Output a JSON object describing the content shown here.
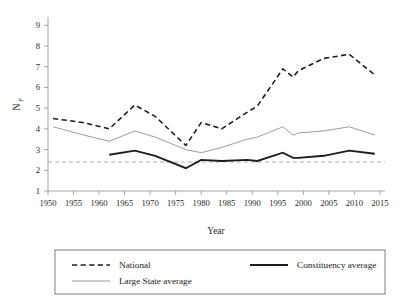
{
  "chart_data": {
    "type": "line",
    "title": "",
    "xlabel": "Year",
    "ylabel": "N_F",
    "ylabel_main": "N",
    "ylabel_sub": "F",
    "xlim": [
      1950,
      2016
    ],
    "ylim": [
      1,
      9.4
    ],
    "grid": false,
    "xticks": [
      1950,
      1955,
      1960,
      1965,
      1970,
      1975,
      1980,
      1985,
      1990,
      1995,
      2000,
      2005,
      2010,
      2015
    ],
    "yticks": [
      1,
      2,
      3,
      4,
      5,
      6,
      7,
      8,
      9
    ],
    "legend_position": "below-outside",
    "reference_lines": [
      {
        "name": "horizontal-reference",
        "y": 2.4,
        "style": "dashed",
        "color": "#a8a8a8"
      }
    ],
    "series": [
      {
        "name": "National",
        "style": "dashed",
        "color": "#1c1c1c",
        "x": [
          1951,
          1957,
          1962,
          1967,
          1971,
          1977,
          1980,
          1984,
          1989,
          1991,
          1996,
          1998,
          1999,
          2004,
          2009,
          2014
        ],
        "values": [
          4.5,
          4.3,
          4.0,
          5.15,
          4.6,
          3.2,
          4.3,
          4.0,
          4.8,
          5.1,
          6.9,
          6.5,
          6.8,
          7.4,
          7.6,
          6.6
        ]
      },
      {
        "name": "Large State average",
        "style": "solid-thin",
        "color": "#9d9d9d",
        "x": [
          1951,
          1957,
          1962,
          1967,
          1971,
          1977,
          1980,
          1984,
          1989,
          1991,
          1996,
          1998,
          1999,
          2004,
          2009,
          2014
        ],
        "values": [
          4.1,
          3.7,
          3.4,
          3.9,
          3.6,
          3.0,
          2.85,
          3.1,
          3.5,
          3.6,
          4.1,
          3.7,
          3.8,
          3.9,
          4.1,
          3.7
        ]
      },
      {
        "name": "Constituency average",
        "style": "solid-thick",
        "color": "#1c1c1c",
        "x": [
          1962,
          1967,
          1971,
          1977,
          1980,
          1984,
          1989,
          1991,
          1996,
          1998,
          1999,
          2004,
          2009,
          2014
        ],
        "values": [
          2.75,
          2.95,
          2.7,
          2.1,
          2.5,
          2.45,
          2.5,
          2.45,
          2.85,
          2.6,
          2.6,
          2.7,
          2.95,
          2.8
        ]
      }
    ]
  },
  "axes": {
    "x_title": "Year",
    "y_title_main": "N",
    "y_title_sub": "F",
    "x_tick_labels": [
      "1950",
      "1955",
      "1960",
      "1965",
      "1970",
      "1975",
      "1980",
      "1985",
      "1990",
      "1995",
      "2000",
      "2005",
      "2010",
      "2015"
    ],
    "y_tick_labels": [
      "1",
      "2",
      "3",
      "4",
      "5",
      "6",
      "7",
      "8",
      "9"
    ]
  },
  "legend": {
    "entries": [
      {
        "label": "National",
        "style": "dashed"
      },
      {
        "label": "Constituency average",
        "style": "solid-thick"
      },
      {
        "label": "Large State average",
        "style": "solid-thin"
      }
    ]
  }
}
